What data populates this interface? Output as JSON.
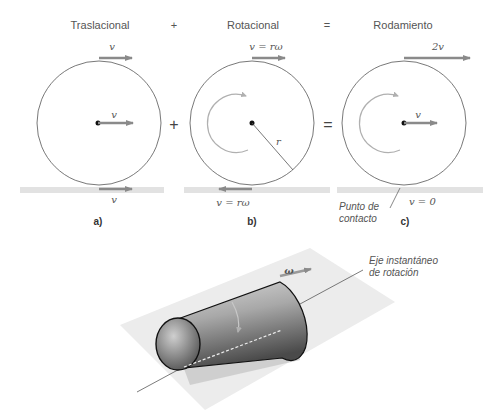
{
  "headers": {
    "translational": "Traslacional",
    "plus": "+",
    "rotational": "Rotacional",
    "equals": "=",
    "rolling": "Rodamiento"
  },
  "operators": {
    "plus": "+",
    "equals": "="
  },
  "panel_a": {
    "top_velocity": "v",
    "center_velocity": "v",
    "bottom_velocity": "v",
    "label": "a)"
  },
  "panel_b": {
    "top_velocity": "v = rω",
    "radius": "r",
    "bottom_velocity": "v  = rω",
    "label": "b)"
  },
  "panel_c": {
    "top_velocity": "2v",
    "center_velocity": "v",
    "contact_velocity": "v = 0",
    "contact_point_line1": "Punto de",
    "contact_point_line2": "contacto",
    "label": "c)"
  },
  "cylinder": {
    "omega": "ω",
    "axis_label_line1": "Eje instantáneo",
    "axis_label_line2": "de rotación"
  },
  "colors": {
    "arrow": "#8a8a8a",
    "ground": "#e2e2e2",
    "circle": "#555555",
    "rotation_arrow": "#b0b0b0"
  }
}
